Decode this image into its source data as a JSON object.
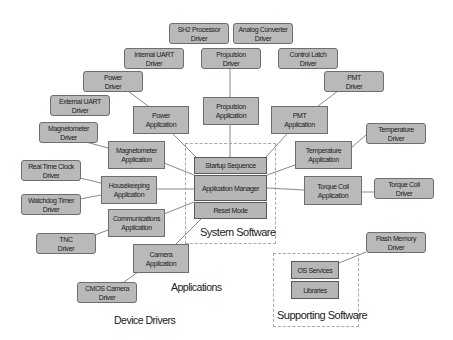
{
  "diagram": {
    "drivers": {
      "sh2_processor": [
        "SH2 Processor",
        "Driver"
      ],
      "analog_converter": [
        "Analog Converter",
        "Driver"
      ],
      "internal_uart": [
        "Internal UART",
        "Driver"
      ],
      "propulsion": [
        "Propulsion",
        "Driver"
      ],
      "control_latch": [
        "Control Latch",
        "Driver"
      ],
      "power": [
        "Power",
        "Driver"
      ],
      "pmt": [
        "PMT",
        "Driver"
      ],
      "external_uart": [
        "External UART",
        "Driver"
      ],
      "magnetometer": [
        "Magnetometer",
        "Driver"
      ],
      "temperature": [
        "Temperature",
        "Driver"
      ],
      "real_time_clock": [
        "Real Time Clock",
        "Driver"
      ],
      "watchdog_timer": [
        "Watchdog Timer",
        "Driver"
      ],
      "torque_coil": [
        "Torque Coil",
        "Driver"
      ],
      "tnc": [
        "TNC",
        "Driver"
      ],
      "cmos_camera": [
        "CMOS Camera",
        "Driver"
      ],
      "flash_memory": [
        "Flash Memory",
        "Driver"
      ]
    },
    "applications": {
      "power": [
        "Power",
        "Application"
      ],
      "propulsion": [
        "Propulsion",
        "Application"
      ],
      "pmt": [
        "PMT",
        "Application"
      ],
      "magnetometer": [
        "Magnetometer",
        "Application"
      ],
      "temperature": [
        "Temperature",
        "Application"
      ],
      "housekeeping": [
        "Housekeeping",
        "Application"
      ],
      "torque_coil": [
        "Torque Coil",
        "Application"
      ],
      "communications": [
        "Communications",
        "Application"
      ],
      "camera": [
        "Camera",
        "Application"
      ]
    },
    "system_software": {
      "label": "System Software",
      "startup": "Startup Sequence",
      "manager": "Application Manager",
      "reset": "Reset Mode"
    },
    "supporting_software": {
      "label": "Supporting Software",
      "os_services": "OS Services",
      "libraries": "Libraries"
    },
    "legend": {
      "applications": "Applications",
      "device_drivers": "Device Drivers"
    },
    "colors": {
      "box_fill": "#b9b9b9",
      "box_border": "#6e6e6e",
      "connector": "#6a6a6a",
      "group_border": "#a8a8a8"
    }
  }
}
